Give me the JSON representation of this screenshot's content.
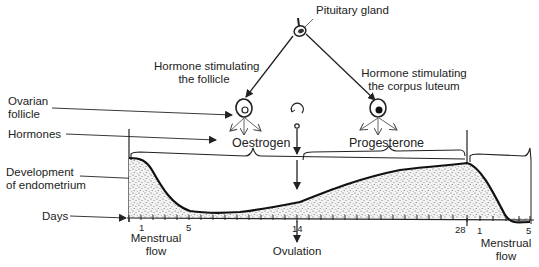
{
  "diagram": {
    "labels": {
      "pituitary": "Pituitary gland",
      "fsh_line1": "Hormone stimulating",
      "fsh_line2": "the follicle",
      "lh_line1": "Hormone stimulating",
      "lh_line2": "the corpus luteum",
      "ovarian_line1": "Ovarian",
      "ovarian_line2": "follicle",
      "hormones": "Hormones",
      "oestrogen": "Oestrogen",
      "progesterone": "Progesterone",
      "endo_line1": "Development",
      "endo_line2": "of endometrium",
      "days": "Days",
      "ovulation": "Ovulation",
      "menstrual1_line1": "Menstrual",
      "menstrual1_line2": "flow",
      "menstrual2_line1": "Menstrual",
      "menstrual2_line2": "flow"
    },
    "day_ticks": {
      "d1": "1",
      "d5": "5",
      "d14": "14",
      "d28": "28",
      "d1b": "1",
      "d5b": "5"
    },
    "caption": "Fig. 13.1  The menstrual cycle"
  }
}
